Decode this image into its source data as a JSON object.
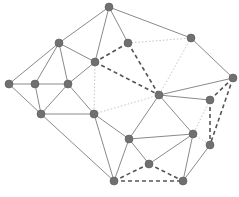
{
  "diagram": {
    "type": "graph",
    "nodes": [
      "A",
      "B",
      "C",
      "D",
      "E",
      "F",
      "G",
      "H",
      "I",
      "J",
      "K",
      "L",
      "M",
      "N",
      "O",
      "P",
      "Q",
      "R",
      "S"
    ],
    "edges": {
      "solid": [
        [
          "A",
          "B"
        ],
        [
          "A",
          "D"
        ],
        [
          "A",
          "C"
        ],
        [
          "A",
          "E"
        ],
        [
          "B",
          "F"
        ],
        [
          "B",
          "G"
        ],
        [
          "B",
          "H"
        ],
        [
          "B",
          "D"
        ],
        [
          "F",
          "G"
        ],
        [
          "F",
          "L"
        ],
        [
          "G",
          "H"
        ],
        [
          "G",
          "L"
        ],
        [
          "H",
          "D"
        ],
        [
          "H",
          "L"
        ],
        [
          "H",
          "M"
        ],
        [
          "L",
          "M"
        ],
        [
          "L",
          "R"
        ],
        [
          "M",
          "N"
        ],
        [
          "M",
          "R"
        ],
        [
          "E",
          "I"
        ],
        [
          "I",
          "J"
        ],
        [
          "J",
          "K"
        ],
        [
          "J",
          "N"
        ],
        [
          "J",
          "O"
        ],
        [
          "N",
          "O"
        ],
        [
          "N",
          "Q"
        ],
        [
          "N",
          "R"
        ],
        [
          "O",
          "Q"
        ],
        [
          "O",
          "S"
        ],
        [
          "P",
          "S"
        ]
      ],
      "dashed": [
        [
          "C",
          "D"
        ],
        [
          "C",
          "J"
        ],
        [
          "D",
          "J"
        ],
        [
          "I",
          "K"
        ],
        [
          "I",
          "P"
        ],
        [
          "K",
          "P"
        ],
        [
          "R",
          "Q"
        ],
        [
          "Q",
          "S"
        ],
        [
          "R",
          "S"
        ]
      ],
      "dotted": [
        [
          "C",
          "E"
        ],
        [
          "E",
          "J"
        ],
        [
          "D",
          "M"
        ],
        [
          "M",
          "J"
        ],
        [
          "K",
          "O"
        ],
        [
          "O",
          "P"
        ]
      ]
    }
  }
}
